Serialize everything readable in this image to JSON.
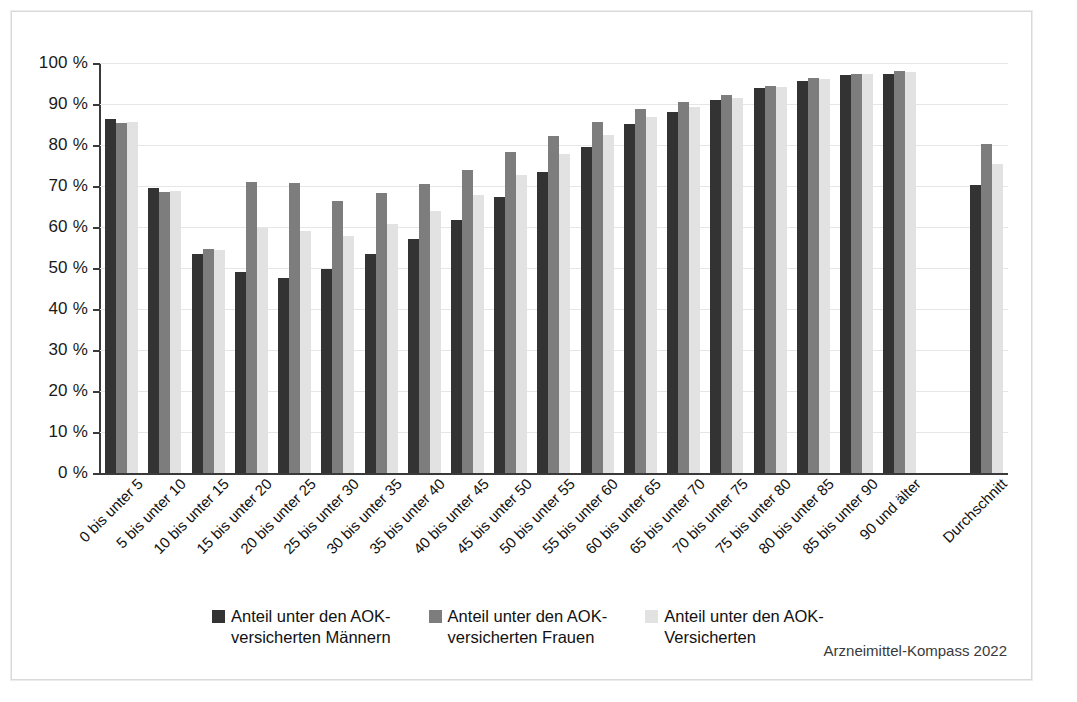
{
  "source_note": "Arzneimittel-Kompass 2022",
  "colors": {
    "series_maenner": "#333333",
    "series_frauen": "#7d7d7d",
    "series_versicherte": "#e2e2e2",
    "gridline": "#e6e6e6",
    "axis": "#3a3a3a",
    "frame": "#d9d9d9"
  },
  "legend": {
    "position": "bottom",
    "items": [
      {
        "label": "Anteil unter den AOK-\nversicherten Männern",
        "color_key": "series_maenner"
      },
      {
        "label": "Anteil unter den AOK-\nversicherten Frauen",
        "color_key": "series_frauen"
      },
      {
        "label": "Anteil unter den AOK-\nVersicherten",
        "color_key": "series_versicherte"
      }
    ]
  },
  "chart_data": {
    "type": "bar",
    "title": "",
    "subtitle": "",
    "xlabel": "",
    "ylabel": "",
    "ylim": [
      0,
      100
    ],
    "grid": true,
    "legend_position": "bottom",
    "y_tick_labels": [
      "100 %",
      "90 %",
      "80 %",
      "70 %",
      "60 %",
      "50 %",
      "40 %",
      "30 %",
      "20 %",
      "10 %",
      "0 %"
    ],
    "y_ticks": [
      100,
      90,
      80,
      70,
      60,
      50,
      40,
      30,
      20,
      10,
      0
    ],
    "categories": [
      "0 bis unter 5",
      "5 bis unter 10",
      "10 bis unter 15",
      "15 bis unter 20",
      "20 bis unter 25",
      "25 bis unter 30",
      "30 bis unter 35",
      "35 bis unter 40",
      "40 bis unter 45",
      "45 bis unter 50",
      "50 bis unter 55",
      "55 bis unter 60",
      "60 bis unter 65",
      "65 bis unter 70",
      "70 bis unter 75",
      "75 bis unter 80",
      "80 bis unter 85",
      "85 bis unter 90",
      "90 und älter",
      "",
      "Durchschnitt"
    ],
    "series": [
      {
        "name": "Anteil unter den AOK-versicherten Männern",
        "color": "#333333",
        "values": [
          86.4,
          69.4,
          53.3,
          49.1,
          47.6,
          49.8,
          53.4,
          57.0,
          61.8,
          67.2,
          73.3,
          79.6,
          85.1,
          88.1,
          90.9,
          93.9,
          95.6,
          97.1,
          97.2,
          null,
          70.3
        ]
      },
      {
        "name": "Anteil unter den AOK-versicherten Frauen",
        "color": "#7d7d7d",
        "values": [
          85.4,
          68.6,
          54.7,
          70.9,
          70.8,
          66.3,
          68.2,
          70.6,
          73.9,
          78.3,
          82.3,
          85.6,
          88.7,
          90.4,
          92.2,
          94.4,
          96.3,
          97.4,
          98.1,
          null,
          80.2
        ]
      },
      {
        "name": "Anteil unter den AOK-Versicherten",
        "color": "#e2e2e2",
        "values": [
          85.7,
          68.7,
          54.3,
          59.7,
          59.0,
          57.7,
          60.8,
          63.8,
          67.8,
          72.7,
          77.7,
          82.5,
          86.9,
          89.2,
          91.5,
          94.1,
          96.0,
          97.2,
          97.9,
          null,
          75.3
        ]
      }
    ]
  }
}
